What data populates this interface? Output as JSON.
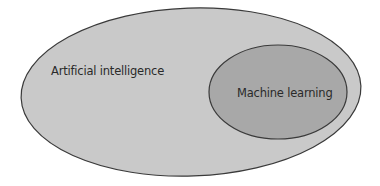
{
  "diagram": {
    "type": "nested-ellipse (Euler diagram)",
    "outer": {
      "label": "Artificial intelligence",
      "fill": "#c9c9c9",
      "stroke": "#3a3a3a"
    },
    "inner": {
      "label": "Machine learning",
      "fill": "#a8a8a8",
      "stroke": "#3a3a3a"
    },
    "relationship": "Machine learning is a subset of Artificial intelligence"
  }
}
